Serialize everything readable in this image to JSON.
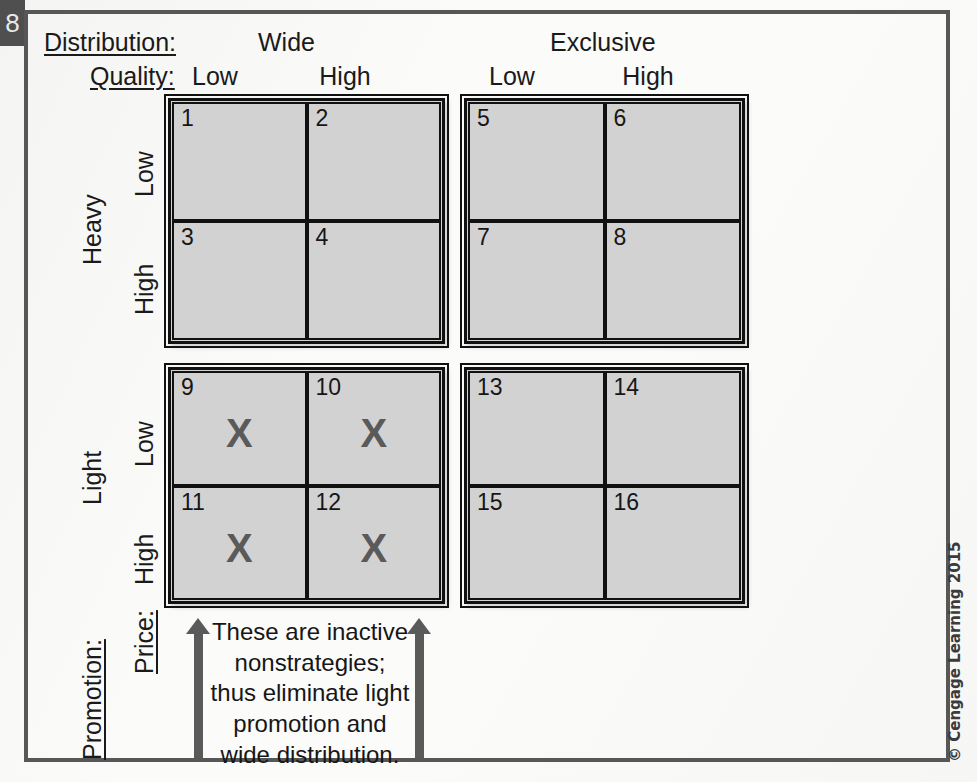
{
  "page_tab": {
    "number": "8"
  },
  "headers": {
    "distribution_label": "Distribution:",
    "quality_label": "Quality:",
    "distribution_groups": [
      "Wide",
      "Exclusive"
    ],
    "quality_columns": [
      "Low",
      "High",
      "Low",
      "High"
    ]
  },
  "row_labels": {
    "promotion_label": "Promotion:",
    "price_label": "Price:",
    "promotion_groups": [
      "Heavy",
      "Light"
    ],
    "price_rows": [
      "Low",
      "High",
      "Low",
      "High"
    ]
  },
  "matrix": {
    "quadrants": [
      {
        "name": "wide-heavy",
        "distribution": "Wide",
        "promotion": "Heavy",
        "cells": [
          {
            "number": "1",
            "mark": ""
          },
          {
            "number": "2",
            "mark": ""
          },
          {
            "number": "3",
            "mark": ""
          },
          {
            "number": "4",
            "mark": ""
          }
        ]
      },
      {
        "name": "exclusive-heavy",
        "distribution": "Exclusive",
        "promotion": "Heavy",
        "cells": [
          {
            "number": "5",
            "mark": ""
          },
          {
            "number": "6",
            "mark": ""
          },
          {
            "number": "7",
            "mark": ""
          },
          {
            "number": "8",
            "mark": ""
          }
        ]
      },
      {
        "name": "wide-light",
        "distribution": "Wide",
        "promotion": "Light",
        "cells": [
          {
            "number": "9",
            "mark": "X"
          },
          {
            "number": "10",
            "mark": "X"
          },
          {
            "number": "11",
            "mark": "X"
          },
          {
            "number": "12",
            "mark": "X"
          }
        ]
      },
      {
        "name": "exclusive-light",
        "distribution": "Exclusive",
        "promotion": "Light",
        "cells": [
          {
            "number": "13",
            "mark": ""
          },
          {
            "number": "14",
            "mark": ""
          },
          {
            "number": "15",
            "mark": ""
          },
          {
            "number": "16",
            "mark": ""
          }
        ]
      }
    ]
  },
  "caption": {
    "text": "These are inactive nonstrategies; thus eliminate light promotion and wide distribution."
  },
  "copyright": {
    "text": "© Cengage Learning 2015"
  },
  "colors": {
    "cell_fill": "#d2d2d2",
    "cell_border": "#111111",
    "mark": "#5a5a5a",
    "arrow": "#5a5a5a",
    "frame": "#575757",
    "text": "#1a1a1a",
    "page_tab": "#4f4f4f"
  }
}
